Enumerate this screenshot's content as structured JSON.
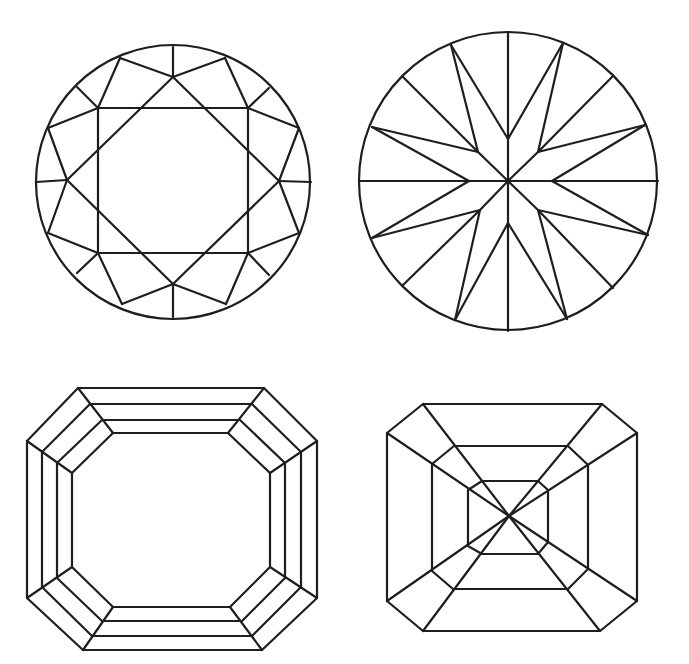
{
  "canvas": {
    "width": 689,
    "height": 664,
    "background": "#ffffff"
  },
  "style": {
    "stroke": "#1e1e1e",
    "stroke_width": 2.2
  },
  "diagrams": [
    {
      "id": "round-brilliant-crown",
      "label": "Round brilliant cut - crown (top) view",
      "circle": {
        "cx": 173,
        "cy": 182,
        "r": 137
      },
      "polylines": [
        [
          [
            98,
            108
          ],
          [
            248,
            108
          ],
          [
            248,
            253
          ],
          [
            98,
            253
          ],
          [
            98,
            108
          ]
        ],
        [
          [
            173,
            77
          ],
          [
            67,
            180
          ],
          [
            173,
            284
          ],
          [
            279,
            181
          ],
          [
            173,
            77
          ]
        ],
        [
          [
            173,
            47
          ],
          [
            173,
            77
          ]
        ],
        [
          [
            36,
            182
          ],
          [
            67,
            180
          ]
        ],
        [
          [
            311,
            182
          ],
          [
            279,
            181
          ]
        ],
        [
          [
            173,
            317
          ],
          [
            173,
            284
          ]
        ],
        [
          [
            120,
            58
          ],
          [
            173,
            77
          ],
          [
            225,
            58
          ]
        ],
        [
          [
            120,
            58
          ],
          [
            98,
            108
          ],
          [
            48,
            128
          ]
        ],
        [
          [
            225,
            58
          ],
          [
            248,
            108
          ],
          [
            299,
            128
          ]
        ],
        [
          [
            48,
            128
          ],
          [
            67,
            180
          ],
          [
            48,
            233
          ]
        ],
        [
          [
            299,
            128
          ],
          [
            279,
            181
          ],
          [
            299,
            233
          ]
        ],
        [
          [
            48,
            233
          ],
          [
            98,
            253
          ],
          [
            122,
            304
          ]
        ],
        [
          [
            299,
            233
          ],
          [
            248,
            253
          ],
          [
            226,
            304
          ]
        ],
        [
          [
            122,
            304
          ],
          [
            173,
            284
          ],
          [
            226,
            304
          ]
        ],
        [
          [
            77,
            87
          ],
          [
            98,
            108
          ]
        ],
        [
          [
            269,
            88
          ],
          [
            248,
            108
          ]
        ],
        [
          [
            269,
            275
          ],
          [
            248,
            253
          ]
        ],
        [
          [
            77,
            273
          ],
          [
            98,
            253
          ]
        ]
      ]
    },
    {
      "id": "round-brilliant-pavilion",
      "label": "Round brilliant cut - pavilion (bottom) view",
      "circle": {
        "cx": 508,
        "cy": 181,
        "r": 149
      },
      "polylines": [
        [
          [
            508,
            32
          ],
          [
            508,
            331
          ]
        ],
        [
          [
            359,
            181
          ],
          [
            658,
            181
          ]
        ],
        [
          [
            403,
            77
          ],
          [
            478,
            152
          ],
          [
            508,
            181
          ]
        ],
        [
          [
            612,
            77
          ],
          [
            538,
            152
          ],
          [
            508,
            181
          ]
        ],
        [
          [
            403,
            285
          ],
          [
            480,
            210
          ],
          [
            508,
            181
          ]
        ],
        [
          [
            613,
            288
          ],
          [
            538,
            210
          ],
          [
            508,
            181
          ]
        ],
        [
          [
            451,
            45
          ],
          [
            478,
            152
          ]
        ],
        [
          [
            451,
            45
          ],
          [
            508,
            139
          ]
        ],
        [
          [
            563,
            43
          ],
          [
            538,
            152
          ]
        ],
        [
          [
            563,
            43
          ],
          [
            508,
            139
          ]
        ],
        [
          [
            372,
            127
          ],
          [
            478,
            152
          ]
        ],
        [
          [
            372,
            127
          ],
          [
            469,
            181
          ]
        ],
        [
          [
            645,
            125
          ],
          [
            538,
            152
          ]
        ],
        [
          [
            645,
            125
          ],
          [
            552,
            181
          ]
        ],
        [
          [
            372,
            238
          ],
          [
            480,
            210
          ]
        ],
        [
          [
            372,
            238
          ],
          [
            469,
            181
          ]
        ],
        [
          [
            648,
            235
          ],
          [
            538,
            210
          ]
        ],
        [
          [
            648,
            235
          ],
          [
            552,
            181
          ]
        ],
        [
          [
            455,
            320
          ],
          [
            480,
            210
          ]
        ],
        [
          [
            455,
            320
          ],
          [
            508,
            223
          ]
        ],
        [
          [
            567,
            319
          ],
          [
            538,
            210
          ]
        ],
        [
          [
            567,
            319
          ],
          [
            508,
            223
          ]
        ]
      ]
    },
    {
      "id": "emerald-crown",
      "label": "Emerald cut - crown (top) view",
      "polylines": [
        [
          [
            78,
            388
          ],
          [
            264,
            388
          ],
          [
            317,
            441
          ],
          [
            317,
            598
          ],
          [
            262,
            650
          ],
          [
            83,
            650
          ],
          [
            27,
            598
          ],
          [
            27,
            441
          ],
          [
            78,
            388
          ]
        ],
        [
          [
            90,
            404
          ],
          [
            252,
            404
          ],
          [
            301,
            452
          ],
          [
            301,
            587
          ],
          [
            252,
            636
          ],
          [
            92,
            636
          ],
          [
            42,
            587
          ],
          [
            42,
            452
          ],
          [
            90,
            404
          ]
        ],
        [
          [
            102,
            420
          ],
          [
            240,
            420
          ],
          [
            285,
            463
          ],
          [
            285,
            578
          ],
          [
            242,
            621
          ],
          [
            102,
            621
          ],
          [
            57,
            578
          ],
          [
            57,
            463
          ],
          [
            102,
            420
          ]
        ],
        [
          [
            113,
            433
          ],
          [
            228,
            433
          ],
          [
            270,
            473
          ],
          [
            270,
            567
          ],
          [
            230,
            607
          ],
          [
            113,
            607
          ],
          [
            72,
            567
          ],
          [
            72,
            473
          ],
          [
            113,
            433
          ]
        ],
        [
          [
            78,
            388
          ],
          [
            113,
            433
          ]
        ],
        [
          [
            27,
            441
          ],
          [
            72,
            473
          ]
        ],
        [
          [
            264,
            388
          ],
          [
            228,
            433
          ]
        ],
        [
          [
            317,
            441
          ],
          [
            270,
            473
          ]
        ],
        [
          [
            317,
            598
          ],
          [
            270,
            567
          ]
        ],
        [
          [
            262,
            650
          ],
          [
            230,
            607
          ]
        ],
        [
          [
            83,
            650
          ],
          [
            113,
            607
          ]
        ],
        [
          [
            27,
            598
          ],
          [
            72,
            567
          ]
        ]
      ]
    },
    {
      "id": "emerald-pavilion",
      "label": "Emerald cut - pavilion (bottom) view",
      "center": [
        509,
        516
      ],
      "polylines": [
        [
          [
            423,
            404
          ],
          [
            602,
            404
          ],
          [
            637,
            433
          ],
          [
            637,
            601
          ],
          [
            600,
            631
          ],
          [
            423,
            631
          ],
          [
            387,
            601
          ],
          [
            387,
            433
          ],
          [
            423,
            404
          ]
        ],
        [
          [
            454,
            446
          ],
          [
            568,
            446
          ],
          [
            588,
            465
          ],
          [
            588,
            569
          ],
          [
            568,
            589
          ],
          [
            453,
            589
          ],
          [
            432,
            571
          ],
          [
            432,
            464
          ],
          [
            454,
            446
          ]
        ],
        [
          [
            482,
            481
          ],
          [
            538,
            481
          ],
          [
            548,
            490
          ],
          [
            548,
            542
          ],
          [
            538,
            554
          ],
          [
            482,
            554
          ],
          [
            468,
            546
          ],
          [
            468,
            490
          ],
          [
            482,
            481
          ]
        ],
        [
          [
            423,
            404
          ],
          [
            509,
            516
          ]
        ],
        [
          [
            387,
            433
          ],
          [
            509,
            516
          ]
        ],
        [
          [
            602,
            404
          ],
          [
            509,
            516
          ]
        ],
        [
          [
            637,
            433
          ],
          [
            509,
            516
          ]
        ],
        [
          [
            637,
            601
          ],
          [
            509,
            516
          ]
        ],
        [
          [
            600,
            631
          ],
          [
            509,
            516
          ]
        ],
        [
          [
            423,
            631
          ],
          [
            509,
            516
          ]
        ],
        [
          [
            387,
            601
          ],
          [
            509,
            516
          ]
        ]
      ]
    }
  ]
}
